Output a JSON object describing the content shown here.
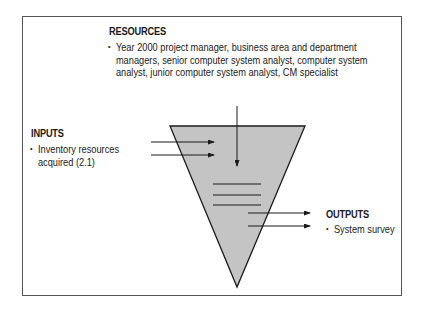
{
  "resources": {
    "heading": "RESOURCES",
    "items": [
      "Year 2000 project manager, business area and department managers, senior computer system analyst, computer system analyst, junior computer system analyst, CM specialist"
    ],
    "lines": [
      "Year 2000 project manager, business area and department",
      "managers, senior computer system analyst, computer system",
      "analyst, junior computer system analyst, CM specialist"
    ]
  },
  "inputs": {
    "heading": "INPUTS",
    "items": [
      "Inventory resources acquired (2.1)"
    ],
    "lines": [
      "Inventory resources",
      "acquired (2.1)"
    ]
  },
  "outputs": {
    "heading": "OUTPUTS",
    "items": [
      "System survey"
    ]
  },
  "colors": {
    "funnel_fill": "#c4c4c4",
    "stroke": "#1a1a1a",
    "frame": "#555555"
  }
}
